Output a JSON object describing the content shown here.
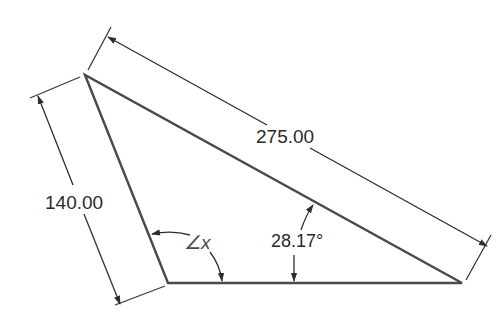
{
  "diagram": {
    "type": "triangle-dimension-drawing",
    "labels": {
      "hypotenuse": "275.00",
      "left_side": "140.00",
      "given_angle": "28.17°",
      "unknown_angle": "∠x"
    },
    "colors": {
      "line": "#4a4a4a",
      "dim_line": "#2e2e2e",
      "text": "#2a2a2a",
      "background": "#ffffff"
    }
  }
}
